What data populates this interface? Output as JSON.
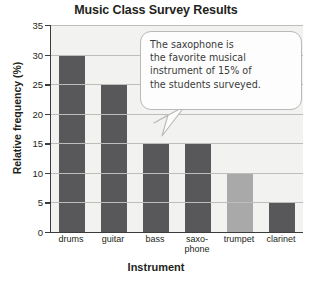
{
  "chart_data": {
    "type": "bar",
    "title": "Music Class Survey Results",
    "xlabel": "Instrument",
    "ylabel": "Relative frequency (%)",
    "categories": [
      "drums",
      "guitar",
      "bass",
      "saxo-phone",
      "trumpet",
      "clarinet"
    ],
    "category_lines": [
      [
        "drums"
      ],
      [
        "guitar"
      ],
      [
        "bass"
      ],
      [
        "saxo-",
        "phone"
      ],
      [
        "trumpet"
      ],
      [
        "clarinet"
      ]
    ],
    "values": [
      30,
      25,
      15,
      15,
      10,
      5
    ],
    "ylim": [
      0,
      35
    ],
    "yticks": [
      0,
      5,
      10,
      15,
      20,
      25,
      30,
      35
    ],
    "grid": true,
    "legend": "none",
    "bar_colors": [
      "#58585a",
      "#58585a",
      "#58585a",
      "#58585a",
      "#a9a9a9",
      "#58585a"
    ],
    "annotations": [
      {
        "name": "saxophone-callout",
        "lines": [
          "The saxophone is",
          "the favorite musical",
          "instrument of 15% of",
          "the students surveyed."
        ],
        "points_to": "saxophone"
      }
    ]
  },
  "colors": {
    "bar_dark": "#58585a",
    "bar_light": "#a9a9a9",
    "plot_background": "#f2f2f0",
    "axis": "#3b3b3b",
    "gridline": "#bdbdbb",
    "text": "#231f20",
    "callout_border": "#b9b9b9"
  }
}
